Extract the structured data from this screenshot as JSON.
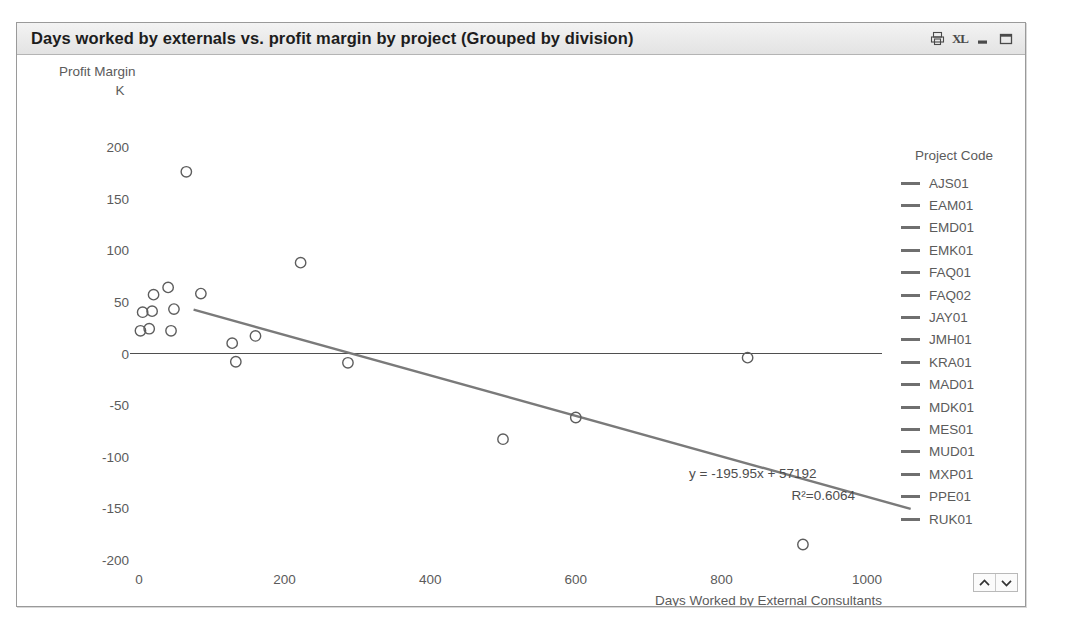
{
  "window": {
    "title": "Days worked by externals vs. profit margin by project (Grouped by division)",
    "buttons": [
      {
        "name": "print-icon",
        "label": "Print"
      },
      {
        "name": "excel-export-icon",
        "label": "XL"
      },
      {
        "name": "minimize-icon",
        "label": "Minimize"
      },
      {
        "name": "maximize-icon",
        "label": "Maximize"
      }
    ]
  },
  "legend": {
    "title": "Project Code",
    "items": [
      {
        "label": "AJS01",
        "color": "#6f6f6f"
      },
      {
        "label": "EAM01",
        "color": "#6f6f6f"
      },
      {
        "label": "EMD01",
        "color": "#6f6f6f"
      },
      {
        "label": "EMK01",
        "color": "#6f6f6f"
      },
      {
        "label": "FAQ01",
        "color": "#6f6f6f"
      },
      {
        "label": "FAQ02",
        "color": "#6f6f6f"
      },
      {
        "label": "JAY01",
        "color": "#6f6f6f"
      },
      {
        "label": "JMH01",
        "color": "#6f6f6f"
      },
      {
        "label": "KRA01",
        "color": "#6f6f6f"
      },
      {
        "label": "MAD01",
        "color": "#6f6f6f"
      },
      {
        "label": "MDK01",
        "color": "#6f6f6f"
      },
      {
        "label": "MES01",
        "color": "#6f6f6f"
      },
      {
        "label": "MUD01",
        "color": "#6f6f6f"
      },
      {
        "label": "MXP01",
        "color": "#6f6f6f"
      },
      {
        "label": "PPE01",
        "color": "#6f6f6f"
      },
      {
        "label": "RUK01",
        "color": "#6f6f6f"
      }
    ],
    "scroll_up": "▲",
    "scroll_down": "▼"
  },
  "chart_data": {
    "type": "scatter",
    "title": "Days worked by externals vs. profit margin by project (Grouped by division)",
    "xlabel": "Days Worked by External Consultants",
    "ylabel": "Profit Margin",
    "yunit": "K",
    "xlim": [
      -45,
      1090
    ],
    "ylim": [
      -215,
      215
    ],
    "xticks": [
      0,
      200,
      400,
      600,
      800,
      1000
    ],
    "yticks": [
      200,
      150,
      100,
      50,
      0,
      -50,
      -100,
      -150,
      -200
    ],
    "grid": false,
    "zero_line": true,
    "legend_position": "right",
    "points": [
      {
        "x": 2,
        "y": 22
      },
      {
        "x": 5,
        "y": 40
      },
      {
        "x": 20,
        "y": 57
      },
      {
        "x": 18,
        "y": 41
      },
      {
        "x": 14,
        "y": 24
      },
      {
        "x": 40,
        "y": 64
      },
      {
        "x": 44,
        "y": 22
      },
      {
        "x": 48,
        "y": 43
      },
      {
        "x": 65,
        "y": 176
      },
      {
        "x": 85,
        "y": 58
      },
      {
        "x": 128,
        "y": 10
      },
      {
        "x": 133,
        "y": -8
      },
      {
        "x": 160,
        "y": 17
      },
      {
        "x": 222,
        "y": 88
      },
      {
        "x": 287,
        "y": -9
      },
      {
        "x": 500,
        "y": -83
      },
      {
        "x": 600,
        "y": -62
      },
      {
        "x": 836,
        "y": -4
      },
      {
        "x": 912,
        "y": -185
      }
    ],
    "trendline": {
      "equation": "y = -195.95x + 57192",
      "r_squared_label": "R²=0.6064",
      "slope_per_unit": -0.19595,
      "intercept": 57.192,
      "x_start": 75,
      "x_end": 1060,
      "color": "#7a7a7a"
    }
  }
}
